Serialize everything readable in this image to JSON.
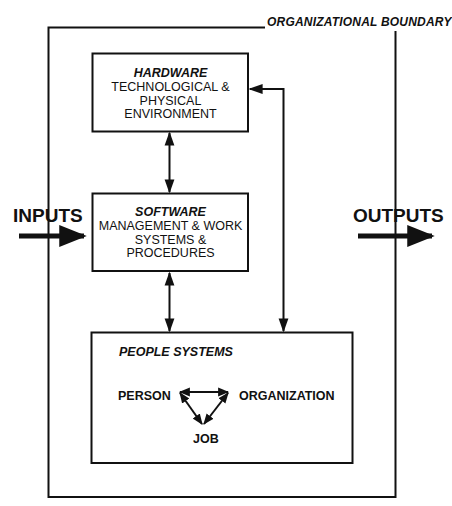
{
  "diagram": {
    "boundary_label": "ORGANIZATIONAL BOUNDARY",
    "inputs_label": "INPUTS",
    "outputs_label": "OUTPUTS",
    "hardware": {
      "title": "HARDWARE",
      "lines": [
        "TECHNOLOGICAL &",
        "PHYSICAL",
        "ENVIRONMENT"
      ]
    },
    "software": {
      "title": "SOFTWARE",
      "lines": [
        "MANAGEMENT & WORK",
        "SYSTEMS &",
        "PROCEDURES"
      ]
    },
    "people": {
      "title": "PEOPLE SYSTEMS",
      "nodes": {
        "person": "PERSON",
        "organization": "ORGANIZATION",
        "job": "JOB"
      }
    },
    "connections": [
      {
        "from": "hardware",
        "to": "software",
        "type": "bidirectional"
      },
      {
        "from": "software",
        "to": "people",
        "type": "bidirectional"
      },
      {
        "from": "hardware",
        "to": "people",
        "type": "bidirectional"
      },
      {
        "from": "person",
        "to": "organization",
        "type": "bidirectional"
      },
      {
        "from": "person",
        "to": "job",
        "type": "bidirectional"
      },
      {
        "from": "organization",
        "to": "job",
        "type": "bidirectional"
      }
    ],
    "colors": {
      "stroke": "#111111",
      "background": "#ffffff"
    }
  }
}
